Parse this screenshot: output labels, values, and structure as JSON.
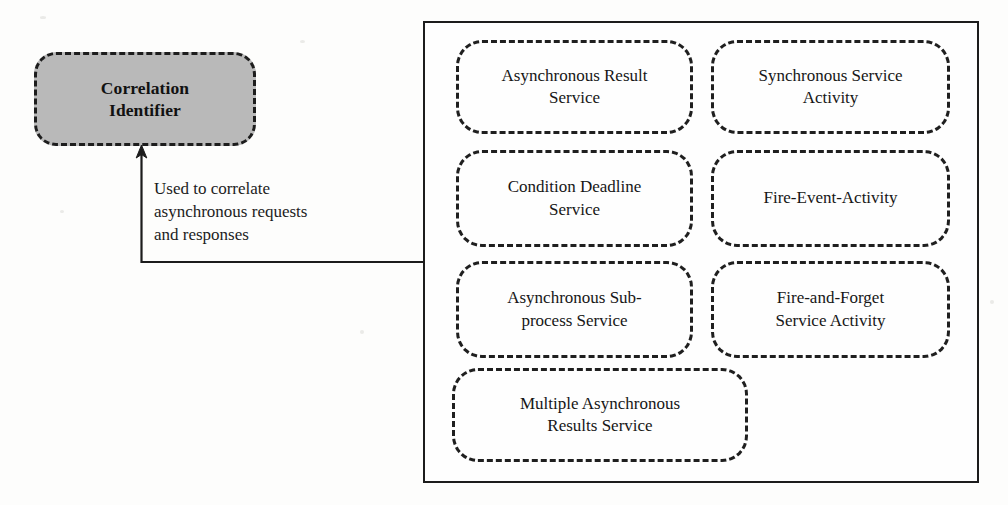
{
  "diagram": {
    "title": "Correlation Identifier",
    "pattern_node": {
      "label_line1": "Correlation",
      "label_line2": "Identifier",
      "fill_color": "#b9b9b9",
      "border_color": "#1d1d1d",
      "border_style": "dashed"
    },
    "annotation": {
      "line1": "Used to correlate",
      "line2": "asynchronous requests",
      "line3": "and responses"
    },
    "connector": {
      "type": "elbow-arrow",
      "direction": "from-panel-to-pattern-node",
      "arrow_head": "up"
    },
    "panel": {
      "border_color": "#1c1c1c",
      "implementations": [
        {
          "id": "asynchronous-result-service",
          "line1": "Asynchronous Result",
          "line2": "Service"
        },
        {
          "id": "synchronous-service-activity",
          "line1": "Synchronous Service",
          "line2": "Activity"
        },
        {
          "id": "condition-deadline-service",
          "line1": "Condition Deadline",
          "line2": "Service"
        },
        {
          "id": "fire-event-activity",
          "line1": "Fire-Event-Activity",
          "line2": ""
        },
        {
          "id": "asynchronous-subprocess-service",
          "line1": "Asynchronous Sub-",
          "line2": "process Service"
        },
        {
          "id": "fire-and-forget-service-activity",
          "line1": "Fire-and-Forget",
          "line2": "Service Activity"
        },
        {
          "id": "multiple-asynchronous-results-service",
          "line1": "Multiple Asynchronous",
          "line2": "Results Service"
        }
      ]
    }
  }
}
